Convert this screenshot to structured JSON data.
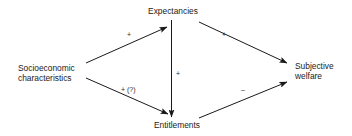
{
  "diagram": {
    "type": "causal-path-diagram",
    "nodes": {
      "expectancies": {
        "label": "Expectancies"
      },
      "socioeconomic": {
        "lines": [
          "Socioeconomic",
          "characteristics"
        ]
      },
      "subjective_welfare": {
        "lines": [
          "Subjective",
          "welfare"
        ]
      },
      "entitlements": {
        "label": "Entitlements"
      }
    },
    "edges": [
      {
        "from": "Socioeconomic characteristics",
        "to": "Expectancies",
        "sign": "+"
      },
      {
        "from": "Expectancies",
        "to": "Subjective welfare",
        "sign": "+"
      },
      {
        "from": "Expectancies",
        "to": "Entitlements",
        "sign": "+"
      },
      {
        "from": "Socioeconomic characteristics",
        "to": "Entitlements",
        "sign": "+ (?)"
      },
      {
        "from": "Entitlements",
        "to": "Subjective welfare",
        "sign": "–"
      }
    ],
    "colors": {
      "line": "#1a1a1a",
      "text": "#1a1a1a",
      "background": "#ffffff"
    }
  }
}
